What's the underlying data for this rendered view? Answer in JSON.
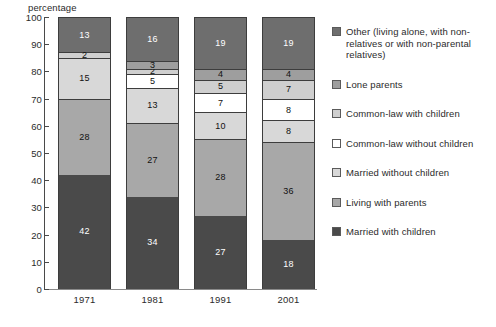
{
  "chart_data": {
    "type": "bar",
    "stacked": true,
    "title": "",
    "subtitle": "",
    "xlabel": "",
    "ylabel": "percentage",
    "ylim": [
      0,
      100
    ],
    "ytick_step": 10,
    "yticks": [
      0,
      10,
      20,
      30,
      40,
      50,
      60,
      70,
      80,
      90,
      100
    ],
    "grid": false,
    "legend_position": "right",
    "categories": [
      "1971",
      "1981",
      "1991",
      "2001"
    ],
    "series": [
      {
        "name": "Married with children",
        "color": "#4a4a4a",
        "text_color": "light",
        "values": [
          42,
          34,
          27,
          18
        ],
        "labels": [
          "42",
          "34",
          "27",
          "18"
        ]
      },
      {
        "name": "Living with parents",
        "color": "#a8a8a8",
        "text_color": "dark",
        "values": [
          28,
          27,
          28,
          36
        ],
        "labels": [
          "28",
          "27",
          "28",
          "36"
        ]
      },
      {
        "name": "Married without children",
        "color": "#d8d8d8",
        "text_color": "dark",
        "values": [
          15,
          13,
          10,
          8
        ],
        "labels": [
          "15",
          "13",
          "10",
          "8"
        ]
      },
      {
        "name": "Common-law without children",
        "color": "#ffffff",
        "text_color": "dark",
        "values": [
          0,
          5,
          7,
          8
        ],
        "labels": [
          "",
          "5",
          "7",
          "8"
        ]
      },
      {
        "name": "Common-law with children",
        "color": "#cfcfcf",
        "text_color": "dark",
        "values": [
          2,
          2,
          5,
          7
        ],
        "labels": [
          "2",
          "2",
          "5",
          "7"
        ]
      },
      {
        "name": "Lone parents",
        "color": "#9e9e9e",
        "text_color": "dark",
        "values": [
          0,
          3,
          4,
          4
        ],
        "labels": [
          "",
          "3",
          "4",
          "4"
        ]
      },
      {
        "name": "Other (living alone, with non-relatives or with non-parental relatives)",
        "color": "#6e6e6e",
        "text_color": "light",
        "values": [
          13,
          16,
          19,
          19
        ],
        "labels": [
          "13",
          "16",
          "19",
          "19"
        ]
      }
    ],
    "legend_entries": [
      {
        "label": "Other (living alone, with non-relatives or with non-parental relatives)",
        "color": "#6e6e6e"
      },
      {
        "label": "Lone parents",
        "color": "#9e9e9e"
      },
      {
        "label": "Common-law with children",
        "color": "#cfcfcf"
      },
      {
        "label": "Common-law without children",
        "color": "#ffffff"
      },
      {
        "label": "Married without children",
        "color": "#d8d8d8"
      },
      {
        "label": "Living with parents",
        "color": "#a8a8a8"
      },
      {
        "label": "Married with children",
        "color": "#4a4a4a"
      }
    ]
  }
}
